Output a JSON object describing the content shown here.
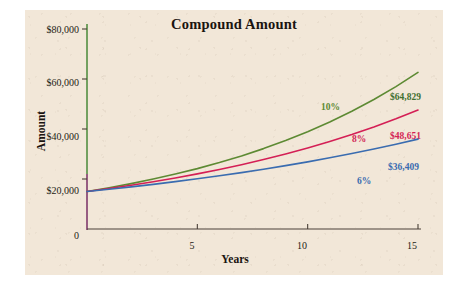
{
  "chart_data": {
    "type": "line",
    "title": "Compound Amount",
    "xlabel": "Years",
    "ylabel": "Amount",
    "xlim": [
      0,
      15
    ],
    "ylim": [
      0,
      80000
    ],
    "x_ticks": [
      "5",
      "10",
      "15"
    ],
    "x_tick_values": [
      5,
      10,
      15
    ],
    "y_ticks": [
      "0",
      "$20,000",
      "$40,000",
      "$60,000",
      "$80,000"
    ],
    "y_tick_values": [
      0,
      20000,
      40000,
      60000,
      80000
    ],
    "grid": false,
    "legend": "inline-labels",
    "principal": 15000,
    "x": [
      0,
      1,
      2,
      3,
      4,
      5,
      6,
      7,
      8,
      9,
      10,
      11,
      12,
      13,
      14,
      15
    ],
    "series": [
      {
        "name": "10%",
        "rate": 0.1,
        "color": "#5d8a33",
        "end_label": "$64,829",
        "end_value": 64829,
        "values": [
          15000,
          16500,
          18150,
          19965,
          21962,
          24158,
          26573,
          29231,
          32154,
          35369,
          38906,
          42797,
          47076,
          51784,
          56963,
          62659
        ]
      },
      {
        "name": "8%",
        "rate": 0.08,
        "color": "#d41f55",
        "end_label": "$48,651",
        "end_value": 48651,
        "values": [
          15000,
          16200,
          17496,
          18896,
          20407,
          22040,
          23803,
          25707,
          27764,
          29985,
          32384,
          34975,
          37773,
          40795,
          44058,
          47583
        ]
      },
      {
        "name": "6%",
        "rate": 0.06,
        "color": "#3a6cb0",
        "end_label": "$36,409",
        "end_value": 36409,
        "values": [
          15000,
          15900,
          16854,
          17865,
          18937,
          20073,
          21278,
          22554,
          23908,
          25342,
          26863,
          28474,
          30183,
          31994,
          33914,
          35949
        ]
      }
    ],
    "annotations": [
      {
        "name": "rate-label-10",
        "text": "10%",
        "color": "#5d8a33"
      },
      {
        "name": "rate-label-8",
        "text": "8%",
        "color": "#d41f55"
      },
      {
        "name": "rate-label-6",
        "text": "6%",
        "color": "#3a6cb0"
      },
      {
        "name": "value-label-10",
        "text": "$64,829",
        "color": "#3f7030"
      },
      {
        "name": "value-label-8",
        "text": "$48,651",
        "color": "#d41f55"
      },
      {
        "name": "value-label-6",
        "text": "$36,409",
        "color": "#3a6cb0"
      }
    ],
    "colors": {
      "background": "#f2e7d8",
      "axis": "#4a4038",
      "axis_upper_tint": "#8ede7a",
      "axis_lower_tint": "#c86fb0",
      "text": "#241c14"
    }
  }
}
